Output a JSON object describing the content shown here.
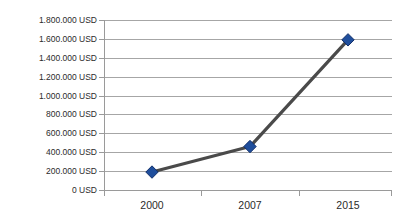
{
  "chart_data": {
    "type": "line",
    "title": "",
    "xlabel": "",
    "ylabel": "",
    "categories": [
      "2000",
      "2007",
      "2015"
    ],
    "values": [
      190000,
      460000,
      1590000
    ],
    "series": [
      {
        "name": "USD",
        "values": [
          190000,
          460000,
          1590000
        ]
      }
    ],
    "ylim": [
      0,
      1800000
    ],
    "ytick_step": 200000,
    "ytick_labels": [
      "0 USD",
      "200.000 USD",
      "400.000 USD",
      "600.000 USD",
      "800.000 USD",
      "1.000.000 USD",
      "1.200.000 USD",
      "1.400.000 USD",
      "1.600.000 USD",
      "1.800.000 USD"
    ],
    "ytick_values": [
      0,
      200000,
      400000,
      600000,
      800000,
      1000000,
      1200000,
      1400000,
      1600000,
      1800000
    ],
    "unit": "USD",
    "grid": true,
    "legend": "none",
    "marker": "diamond",
    "colors": {
      "marker_fill": "#1F4E9C",
      "marker_edge": "#12306b",
      "line": "#4a4a4a",
      "gridline": "#a6a6a6",
      "axis": "#9a9a9a",
      "text": "#2b2b2b",
      "background": "#ffffff"
    }
  }
}
